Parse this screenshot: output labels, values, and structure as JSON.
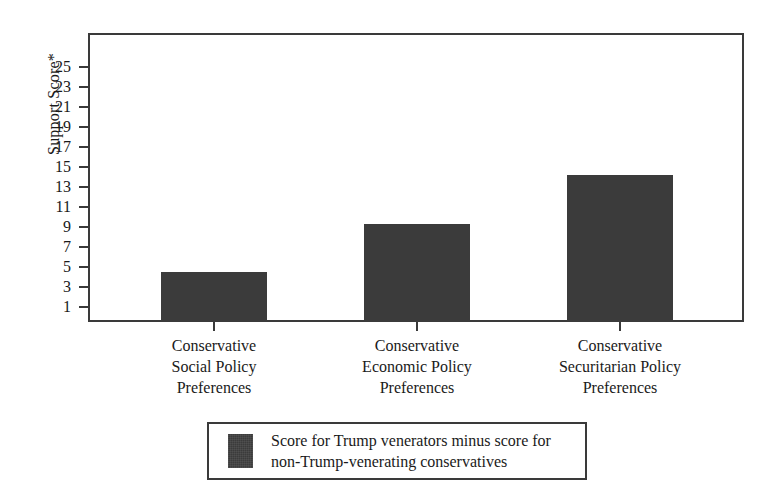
{
  "chart_data": {
    "type": "bar",
    "title": "",
    "xlabel": "",
    "ylabel": "Support Score*",
    "categories": [
      "Conservative Social Policy Preferences",
      "Conservative Economic Policy Preferences",
      "Conservative Securitarian Policy Preferences"
    ],
    "category_lines": [
      [
        "Conservative",
        "Social Policy",
        "Preferences"
      ],
      [
        "Conservative",
        "Economic Policy",
        "Preferences"
      ],
      [
        "Conservative",
        "Securitarian Policy",
        "Preferences"
      ]
    ],
    "values": [
      4.5,
      9.3,
      14.2
    ],
    "series": [
      {
        "name": "Score for Trump venerators minus score for non-Trump-venerating conservatives",
        "values": [
          4.5,
          9.3,
          14.2
        ],
        "color": "#3b3b3b"
      }
    ],
    "ylim": [
      0,
      26
    ],
    "y_ticks": [
      1,
      3,
      5,
      7,
      9,
      11,
      13,
      15,
      17,
      19,
      21,
      23,
      25
    ],
    "y_tick_labels": [
      "1",
      "3",
      "5",
      "7",
      "9",
      "11",
      "13",
      "15",
      "17",
      "19",
      "21",
      "23",
      "25"
    ],
    "grid": false,
    "legend_position": "bottom-center"
  },
  "axis": {
    "y_title": "Support Score*"
  },
  "legend": {
    "entries": [
      {
        "label_lines": [
          "Score for Trump venerators minus score for",
          "non-Trump-venerating conservatives"
        ],
        "color": "#3b3b3b"
      }
    ]
  },
  "colors": {
    "bar_fill": "#3b3b3b",
    "frame": "#3a3a3a",
    "background": "#ffffff",
    "text": "#1a1a1a"
  }
}
